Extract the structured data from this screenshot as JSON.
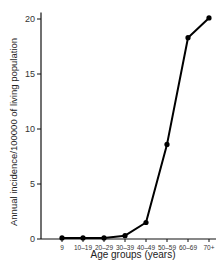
{
  "chart_data": {
    "type": "line",
    "title": "",
    "xlabel": "Age groups (years)",
    "ylabel": "Annual incidence/100000 of living population",
    "categories": [
      "9",
      "10–19",
      "20–29",
      "30–39",
      "40–49",
      "50–59",
      "60–69",
      "70+"
    ],
    "series": [
      {
        "name": "Annual incidence",
        "values": [
          0.1,
          0.1,
          0.1,
          0.3,
          1.5,
          8.6,
          18.3,
          20.1
        ]
      }
    ],
    "yticks": [
      0,
      5,
      10,
      15,
      20
    ],
    "ylim": [
      0,
      20.5
    ],
    "grid": false,
    "legend": "none",
    "line_color": "#000000",
    "marker": "circle"
  }
}
